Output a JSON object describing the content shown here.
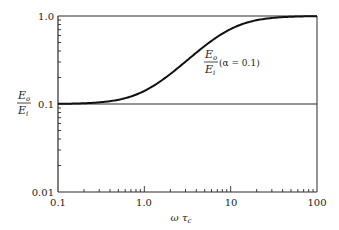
{
  "chart_data": {
    "type": "line",
    "title": "",
    "xlabel": "ωτc",
    "ylabel": "Eo/Ei",
    "xscale": "log",
    "yscale": "log",
    "xlim": [
      0.1,
      100
    ],
    "ylim": [
      0.01,
      1.0
    ],
    "grid": false,
    "x_ticks": [
      "0.1",
      "1.0",
      "10",
      "100"
    ],
    "y_ticks": [
      "0.01",
      "0.1",
      "1.0"
    ],
    "reference_lines": [
      {
        "y": 0.1,
        "label": "asymptote 0.1"
      },
      {
        "y": 1.0,
        "label": "asymptote 1.0"
      }
    ],
    "series": [
      {
        "name": "Eo/Ei (α = 0.1)",
        "alpha": 0.1,
        "x": [
          0.1,
          0.2,
          0.3,
          0.5,
          0.7,
          1.0,
          1.5,
          2.0,
          3.0,
          3.16,
          5.0,
          7.0,
          10,
          15,
          20,
          30,
          50,
          70,
          100
        ],
        "y": [
          0.1,
          0.102,
          0.104,
          0.112,
          0.122,
          0.141,
          0.18,
          0.219,
          0.3,
          0.316,
          0.456,
          0.564,
          0.711,
          0.833,
          0.906,
          0.953,
          0.983,
          0.991,
          0.995
        ]
      }
    ],
    "annotations": [
      {
        "text_numerator": "Eo",
        "text_denominator": "Ei",
        "text_suffix": "(α = 0.1)",
        "x": 15,
        "y": 0.45
      }
    ]
  },
  "labels": {
    "y_axis": {
      "num": "E",
      "num_sub": "o",
      "den": "E",
      "den_sub": "i"
    },
    "x_axis": {
      "main": "ω τ",
      "sub": "c"
    },
    "curve_label": {
      "num": "E",
      "num_sub": "o",
      "den": "E",
      "den_sub": "i",
      "suffix": "(α = 0.1)"
    },
    "x_ticks": [
      "0.1",
      "1.0",
      "10",
      "100"
    ],
    "y_ticks": [
      "1.0",
      "0.1",
      "0.01"
    ]
  }
}
